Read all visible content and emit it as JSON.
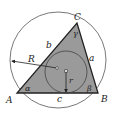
{
  "diagram": {
    "colors": {
      "fill": "#9a9a9a",
      "stroke": "#222222",
      "circle": "#555555",
      "background": "#ffffff"
    },
    "vertices": {
      "A": "A",
      "B": "B",
      "C": "C"
    },
    "sides": {
      "a": "a",
      "b": "b",
      "c": "c"
    },
    "angles": {
      "alpha": "α",
      "beta": "β",
      "gamma": "γ"
    },
    "radii": {
      "circumradius": "R",
      "inradius": "r"
    }
  }
}
